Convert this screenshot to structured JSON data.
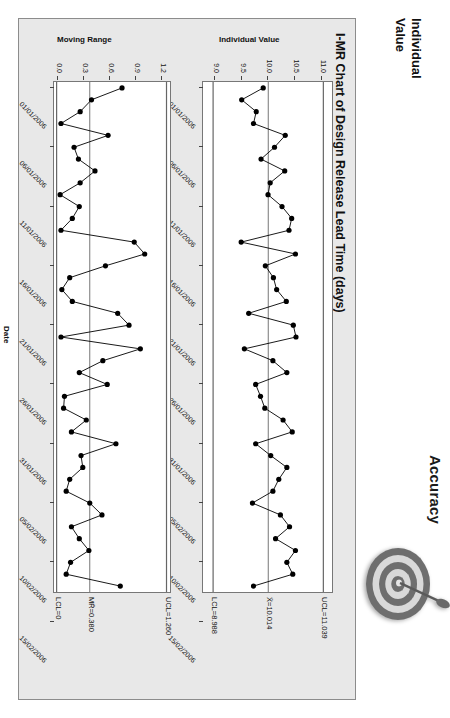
{
  "icons": [
    {
      "name": "accuracy-target",
      "label": "Accuracy",
      "arrows": 1
    },
    {
      "name": "precision-target",
      "label": "Precision",
      "arrows": 3
    }
  ],
  "side_captions": [
    {
      "name": "individual-value-caption",
      "text": "Individual\nValue"
    },
    {
      "name": "moving-range-caption",
      "text": "Moving\nRange"
    }
  ],
  "chart_data": {
    "type": "line",
    "title": "I-MR Chart of Design Release Lead Time (days)",
    "xlabel": "Date",
    "grid": false,
    "legend": "none",
    "x_tick_labels": [
      "01/01/2006",
      "06/01/2006",
      "11/01/2006",
      "16/01/2006",
      "21/01/2006",
      "26/01/2006",
      "31/01/2006",
      "05/02/2006",
      "10/02/2006",
      "15/02/2006"
    ],
    "panels": [
      {
        "name": "individuals-chart",
        "ylabel": "Individual Value",
        "ylim": [
          8.8,
          11.2
        ],
        "y_tick_labels": [
          "11.0",
          "10.5",
          "10.0",
          "9.5",
          "9.0"
        ],
        "y_tick_values": [
          11.0,
          10.5,
          10.0,
          9.5,
          9.0
        ],
        "limits": [
          {
            "name": "ucl",
            "label": "UCL=11.039",
            "value": 11.039
          },
          {
            "name": "center",
            "label": "X̄=10.014",
            "value": 10.014
          },
          {
            "name": "lcl",
            "label": "LCL=8.988",
            "value": 8.988
          }
        ],
        "values": [
          9.92,
          9.52,
          9.79,
          9.74,
          10.33,
          10.13,
          9.88,
          10.32,
          10.05,
          10.01,
          10.27,
          10.45,
          10.4,
          9.51,
          10.52,
          9.96,
          10.11,
          10.17,
          10.35,
          9.65,
          10.48,
          10.53,
          9.57,
          10.1,
          10.36,
          9.78,
          9.87,
          9.95,
          10.29,
          10.46,
          9.78,
          10.06,
          10.36,
          10.21,
          10.1,
          9.72,
          10.24,
          10.41,
          10.15,
          10.52,
          10.36,
          10.47,
          9.74
        ]
      },
      {
        "name": "moving-range-chart",
        "ylabel": "Moving Range",
        "ylim": [
          -0.03,
          1.3
        ],
        "y_tick_labels": [
          "1.2",
          "0.9",
          "0.6",
          "0.3",
          "0.0"
        ],
        "y_tick_values": [
          1.2,
          0.9,
          0.6,
          0.3,
          0.0
        ],
        "limits": [
          {
            "name": "ucl",
            "label": "UCL=1.260",
            "value": 1.26
          },
          {
            "name": "center",
            "label": "MR̄=0.380",
            "value": 0.38
          },
          {
            "name": "lcl",
            "label": "LCL=0",
            "value": 0.0
          }
        ],
        "values": [
          0.75,
          0.4,
          0.27,
          0.05,
          0.59,
          0.2,
          0.25,
          0.44,
          0.27,
          0.04,
          0.26,
          0.18,
          0.05,
          0.89,
          1.01,
          0.56,
          0.15,
          0.06,
          0.18,
          0.7,
          0.83,
          0.05,
          0.96,
          0.53,
          0.26,
          0.58,
          0.09,
          0.08,
          0.34,
          0.17,
          0.68,
          0.28,
          0.3,
          0.15,
          0.11,
          0.38,
          0.52,
          0.17,
          0.26,
          0.37,
          0.16,
          0.11,
          0.73
        ]
      }
    ]
  },
  "colors": {
    "panel_background": "#e8e8e8",
    "plot_background": "#ffffff",
    "series": "#000000",
    "axis": "#444444",
    "limit_line": "#666666"
  }
}
